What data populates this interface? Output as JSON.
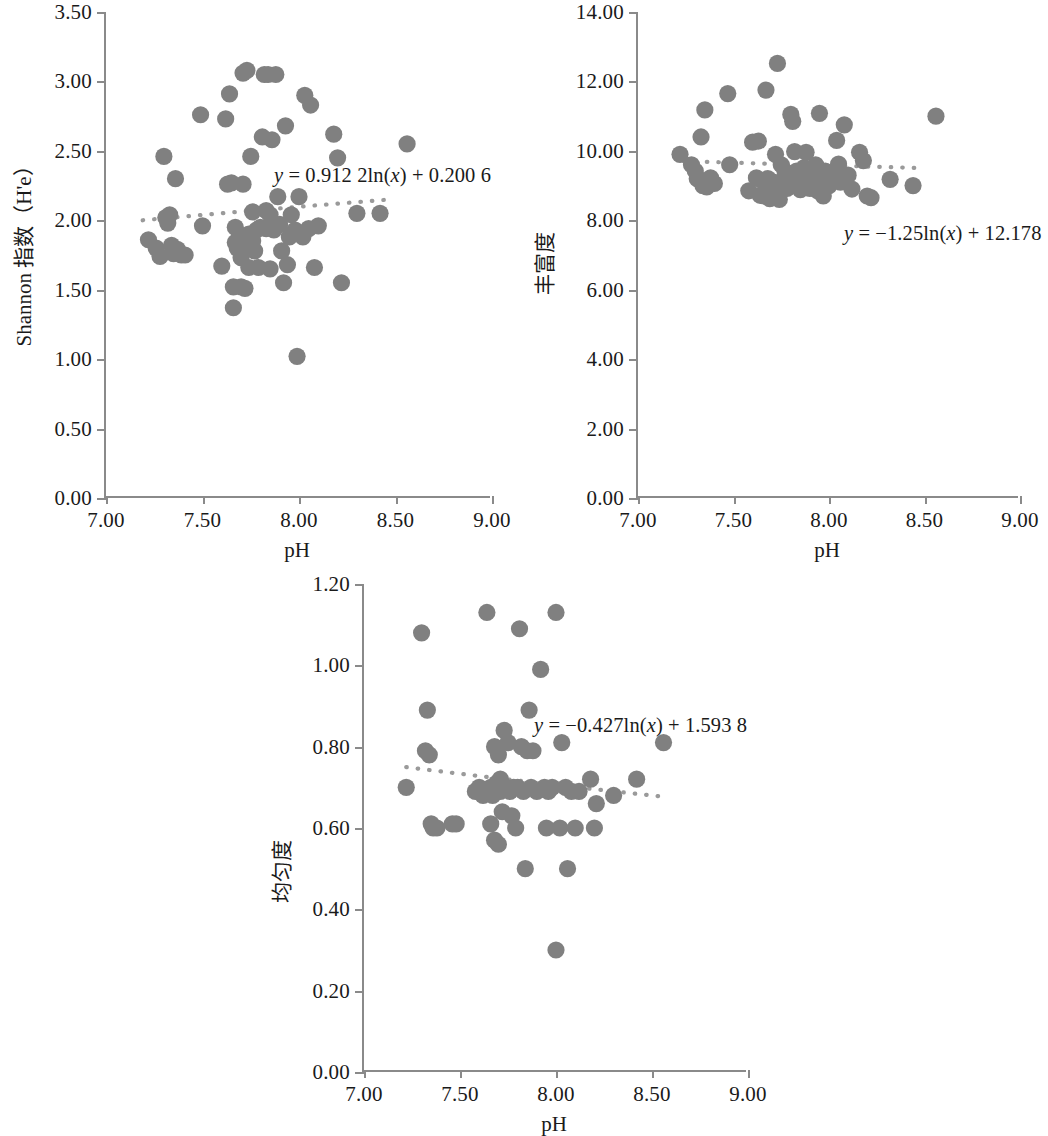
{
  "figure": {
    "marker_color": "#808080",
    "trendline_color": "#9a9a9a",
    "axis_color": "#8a8a8a"
  },
  "charts": [
    {
      "id": "shannon",
      "y_title": "Shannon 指数（H'e）",
      "x_title": "pH",
      "equation": "y = 0.912 2ln(x) + 0.200 6",
      "equation_parts": {
        "lhs": "y",
        "rhs": " = 0.912 2ln(",
        "var": "x",
        "tail": ") + 0.200 6"
      },
      "chart_data": {
        "type": "scatter",
        "title": "",
        "xlabel": "pH",
        "ylabel": "Shannon 指数（H'e）",
        "xlim": [
          7.0,
          9.0
        ],
        "ylim": [
          0.0,
          3.5
        ],
        "xticks": [
          "7.00",
          "7.50",
          "8.00",
          "8.50",
          "9.00"
        ],
        "yticks": [
          "0.00",
          "0.50",
          "1.00",
          "1.50",
          "2.00",
          "2.50",
          "3.00",
          "3.50"
        ],
        "grid": false,
        "legend": "none",
        "trendline": {
          "kind": "logarithmic",
          "equation": "y = 0.912 2ln(x) + 0.200 6",
          "a": 0.9122,
          "b": 0.2006,
          "x_start": 7.19,
          "x_end": 8.47,
          "style": "dotted"
        },
        "points": [
          [
            7.22,
            1.86
          ],
          [
            7.26,
            1.8
          ],
          [
            7.28,
            1.74
          ],
          [
            7.3,
            2.46
          ],
          [
            7.31,
            2.02
          ],
          [
            7.32,
            1.98
          ],
          [
            7.33,
            2.04
          ],
          [
            7.34,
            1.82
          ],
          [
            7.35,
            1.76
          ],
          [
            7.36,
            2.3
          ],
          [
            7.37,
            1.79
          ],
          [
            7.39,
            1.75
          ],
          [
            7.41,
            1.75
          ],
          [
            7.49,
            2.76
          ],
          [
            7.5,
            1.96
          ],
          [
            7.6,
            1.67
          ],
          [
            7.62,
            2.73
          ],
          [
            7.63,
            2.26
          ],
          [
            7.64,
            2.91
          ],
          [
            7.65,
            2.27
          ],
          [
            7.66,
            1.37
          ],
          [
            7.66,
            1.52
          ],
          [
            7.67,
            1.84
          ],
          [
            7.67,
            1.95
          ],
          [
            7.68,
            1.8
          ],
          [
            7.69,
            1.88
          ],
          [
            7.7,
            1.52
          ],
          [
            7.7,
            1.73
          ],
          [
            7.71,
            2.26
          ],
          [
            7.71,
            3.06
          ],
          [
            7.72,
            1.51
          ],
          [
            7.72,
            1.8
          ],
          [
            7.73,
            3.08
          ],
          [
            7.74,
            1.66
          ],
          [
            7.74,
            1.9
          ],
          [
            7.75,
            2.46
          ],
          [
            7.76,
            1.85
          ],
          [
            7.76,
            2.06
          ],
          [
            7.77,
            1.78
          ],
          [
            7.78,
            1.93
          ],
          [
            7.79,
            1.66
          ],
          [
            7.8,
            1.95
          ],
          [
            7.81,
            2.6
          ],
          [
            7.82,
            3.05
          ],
          [
            7.83,
            1.94
          ],
          [
            7.83,
            2.07
          ],
          [
            7.84,
            3.05
          ],
          [
            7.85,
            1.65
          ],
          [
            7.85,
            2.04
          ],
          [
            7.86,
            2.58
          ],
          [
            7.87,
            1.93
          ],
          [
            7.88,
            3.05
          ],
          [
            7.89,
            2.17
          ],
          [
            7.9,
            1.97
          ],
          [
            7.91,
            1.78
          ],
          [
            7.92,
            1.55
          ],
          [
            7.93,
            2.68
          ],
          [
            7.94,
            1.68
          ],
          [
            7.95,
            1.88
          ],
          [
            7.96,
            2.04
          ],
          [
            7.98,
            1.93
          ],
          [
            7.99,
            1.02
          ],
          [
            8.0,
            2.17
          ],
          [
            8.02,
            1.88
          ],
          [
            8.03,
            2.9
          ],
          [
            8.05,
            1.94
          ],
          [
            8.06,
            2.83
          ],
          [
            8.08,
            1.66
          ],
          [
            8.1,
            1.96
          ],
          [
            8.18,
            2.62
          ],
          [
            8.2,
            2.45
          ],
          [
            8.22,
            1.55
          ],
          [
            8.3,
            2.05
          ],
          [
            8.42,
            2.05
          ],
          [
            8.56,
            2.55
          ]
        ]
      }
    },
    {
      "id": "richness",
      "y_title": "丰富度",
      "x_title": "pH",
      "equation": "y = −1.25ln(x) + 12.178",
      "equation_parts": {
        "lhs": "y",
        "rhs": " = −1.25ln(",
        "var": "x",
        "tail": ") + 12.178"
      },
      "chart_data": {
        "type": "scatter",
        "title": "",
        "xlabel": "pH",
        "ylabel": "丰富度",
        "xlim": [
          7.0,
          9.0
        ],
        "ylim": [
          0.0,
          14.0
        ],
        "xticks": [
          "7.00",
          "7.50",
          "8.00",
          "8.50",
          "9.00"
        ],
        "yticks": [
          "0.00",
          "2.00",
          "4.00",
          "6.00",
          "8.00",
          "10.00",
          "12.00",
          "14.00"
        ],
        "grid": false,
        "legend": "none",
        "trendline": {
          "kind": "logarithmic",
          "equation": "y = −1.25ln(x) + 12.178",
          "a": -1.25,
          "b": 12.178,
          "x_start": 7.24,
          "x_end": 8.46,
          "style": "dotted"
        },
        "points": [
          [
            7.22,
            9.9
          ],
          [
            7.28,
            9.6
          ],
          [
            7.3,
            9.42
          ],
          [
            7.31,
            9.2
          ],
          [
            7.32,
            9.18
          ],
          [
            7.33,
            10.4
          ],
          [
            7.34,
            9.0
          ],
          [
            7.35,
            11.18
          ],
          [
            7.36,
            8.96
          ],
          [
            7.37,
            9.15
          ],
          [
            7.38,
            9.22
          ],
          [
            7.4,
            9.06
          ],
          [
            7.47,
            11.65
          ],
          [
            7.48,
            9.6
          ],
          [
            7.58,
            8.85
          ],
          [
            7.6,
            10.25
          ],
          [
            7.62,
            9.22
          ],
          [
            7.63,
            10.28
          ],
          [
            7.64,
            8.72
          ],
          [
            7.65,
            9.14
          ],
          [
            7.66,
            8.7
          ],
          [
            7.67,
            11.75
          ],
          [
            7.68,
            9.2
          ],
          [
            7.69,
            8.62
          ],
          [
            7.7,
            8.95
          ],
          [
            7.71,
            9.1
          ],
          [
            7.72,
            9.9
          ],
          [
            7.73,
            12.52
          ],
          [
            7.74,
            8.6
          ],
          [
            7.75,
            9.6
          ],
          [
            7.76,
            9.08
          ],
          [
            7.77,
            9.4
          ],
          [
            7.78,
            8.92
          ],
          [
            7.79,
            9.05
          ],
          [
            7.8,
            11.05
          ],
          [
            7.81,
            10.85
          ],
          [
            7.82,
            9.98
          ],
          [
            7.83,
            9.42
          ],
          [
            7.84,
            9.3
          ],
          [
            7.85,
            8.88
          ],
          [
            7.86,
            9.2
          ],
          [
            7.87,
            9.52
          ],
          [
            7.88,
            9.96
          ],
          [
            7.89,
            9.1
          ],
          [
            7.9,
            8.92
          ],
          [
            7.91,
            9.32
          ],
          [
            7.92,
            9.28
          ],
          [
            7.93,
            9.6
          ],
          [
            7.94,
            8.85
          ],
          [
            7.95,
            11.08
          ],
          [
            7.96,
            9.18
          ],
          [
            7.97,
            8.7
          ],
          [
            7.98,
            9.42
          ],
          [
            7.99,
            9.28
          ],
          [
            8.0,
            9.0
          ],
          [
            8.02,
            9.38
          ],
          [
            8.04,
            10.3
          ],
          [
            8.05,
            9.62
          ],
          [
            8.06,
            9.1
          ],
          [
            8.08,
            10.75
          ],
          [
            8.1,
            9.3
          ],
          [
            8.12,
            8.9
          ],
          [
            8.16,
            9.96
          ],
          [
            8.18,
            9.72
          ],
          [
            8.2,
            8.7
          ],
          [
            8.22,
            8.65
          ],
          [
            8.32,
            9.18
          ],
          [
            8.44,
            9.0
          ],
          [
            8.56,
            11.0
          ]
        ]
      }
    },
    {
      "id": "evenness",
      "y_title": "均匀度",
      "x_title": "pH",
      "equation": "y = −0.427ln(x) + 1.593 8",
      "equation_parts": {
        "lhs": "y",
        "rhs": " = −0.427ln(",
        "var": "x",
        "tail": ") + 1.593 8"
      },
      "chart_data": {
        "type": "scatter",
        "title": "",
        "xlabel": "pH",
        "ylabel": "均匀度",
        "xlim": [
          7.0,
          9.0
        ],
        "ylim": [
          0.0,
          1.2
        ],
        "xticks": [
          "7.00",
          "7.50",
          "8.00",
          "8.50",
          "9.00"
        ],
        "yticks": [
          "0.00",
          "0.20",
          "0.40",
          "0.60",
          "0.80",
          "1.00",
          "1.20"
        ],
        "grid": false,
        "legend": "none",
        "trendline": {
          "kind": "logarithmic",
          "equation": "y = −0.427ln(x) + 1.593 8",
          "a": -0.427,
          "b": 1.5938,
          "x_start": 7.22,
          "x_end": 8.54,
          "style": "dotted"
        },
        "points": [
          [
            7.22,
            0.7
          ],
          [
            7.3,
            1.08
          ],
          [
            7.32,
            0.79
          ],
          [
            7.33,
            0.89
          ],
          [
            7.34,
            0.78
          ],
          [
            7.35,
            0.61
          ],
          [
            7.36,
            0.6
          ],
          [
            7.38,
            0.6
          ],
          [
            7.46,
            0.61
          ],
          [
            7.48,
            0.61
          ],
          [
            7.58,
            0.69
          ],
          [
            7.6,
            0.7
          ],
          [
            7.62,
            0.68
          ],
          [
            7.64,
            1.13
          ],
          [
            7.65,
            0.69
          ],
          [
            7.66,
            0.7
          ],
          [
            7.66,
            0.61
          ],
          [
            7.67,
            0.68
          ],
          [
            7.68,
            0.8
          ],
          [
            7.68,
            0.57
          ],
          [
            7.69,
            0.71
          ],
          [
            7.7,
            0.56
          ],
          [
            7.7,
            0.78
          ],
          [
            7.71,
            0.69
          ],
          [
            7.71,
            0.72
          ],
          [
            7.72,
            0.64
          ],
          [
            7.72,
            0.7
          ],
          [
            7.73,
            0.84
          ],
          [
            7.74,
            0.7
          ],
          [
            7.75,
            0.81
          ],
          [
            7.76,
            0.69
          ],
          [
            7.77,
            0.63
          ],
          [
            7.78,
            0.7
          ],
          [
            7.79,
            0.6
          ],
          [
            7.8,
            0.7
          ],
          [
            7.81,
            1.09
          ],
          [
            7.82,
            0.8
          ],
          [
            7.83,
            0.69
          ],
          [
            7.84,
            0.5
          ],
          [
            7.85,
            0.79
          ],
          [
            7.86,
            0.89
          ],
          [
            7.87,
            0.7
          ],
          [
            7.88,
            0.79
          ],
          [
            7.9,
            0.69
          ],
          [
            7.92,
            0.99
          ],
          [
            7.94,
            0.7
          ],
          [
            7.95,
            0.6
          ],
          [
            7.96,
            0.69
          ],
          [
            7.98,
            0.7
          ],
          [
            8.0,
            1.13
          ],
          [
            8.0,
            0.3
          ],
          [
            8.02,
            0.6
          ],
          [
            8.03,
            0.81
          ],
          [
            8.05,
            0.7
          ],
          [
            8.06,
            0.5
          ],
          [
            8.08,
            0.69
          ],
          [
            8.1,
            0.6
          ],
          [
            8.12,
            0.69
          ],
          [
            8.18,
            0.72
          ],
          [
            8.2,
            0.6
          ],
          [
            8.21,
            0.66
          ],
          [
            8.3,
            0.68
          ],
          [
            8.42,
            0.72
          ],
          [
            8.56,
            0.81
          ]
        ]
      }
    }
  ]
}
